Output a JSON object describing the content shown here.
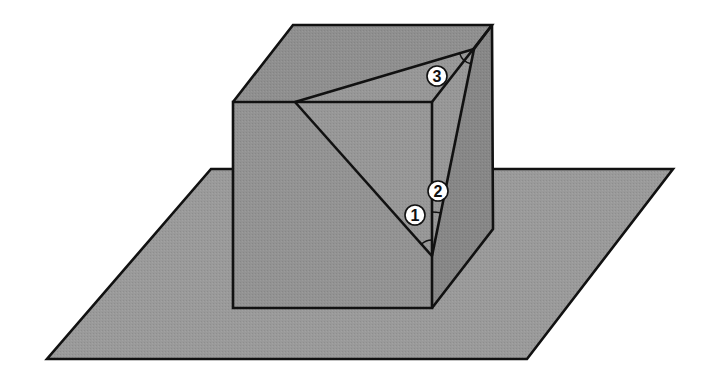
{
  "figure": {
    "colors": {
      "background": "#ffffff",
      "plane": "#9a9a9a",
      "top_face": "#8f8f8f",
      "front_face": "#939393",
      "right_face": "#878787",
      "section": "#979797",
      "edge": "#111111"
    },
    "plane": {
      "points": [
        [
          211,
          169
        ],
        [
          673,
          169
        ],
        [
          527,
          359
        ],
        [
          47,
          359
        ]
      ]
    },
    "cube": {
      "front_face": [
        [
          233,
          102
        ],
        [
          432,
          102
        ],
        [
          432,
          308
        ],
        [
          233,
          308
        ]
      ],
      "top_face": [
        [
          233,
          102
        ],
        [
          293,
          25
        ],
        [
          492,
          25
        ],
        [
          432,
          102
        ]
      ],
      "right_face": [
        [
          432,
          102
        ],
        [
          492,
          25
        ],
        [
          493,
          229
        ],
        [
          432,
          308
        ]
      ]
    },
    "section_triangle": {
      "vertices": [
        [
          295,
          102
        ],
        [
          474,
          49
        ],
        [
          432,
          256
        ]
      ]
    },
    "angles": [
      {
        "label": "1",
        "center": [
          415,
          215
        ]
      },
      {
        "label": "2",
        "center": [
          438,
          191
        ]
      },
      {
        "label": "3",
        "center": [
          437,
          76
        ]
      }
    ]
  }
}
